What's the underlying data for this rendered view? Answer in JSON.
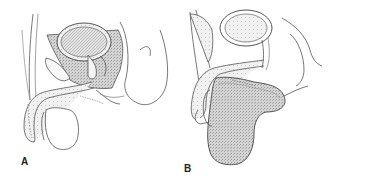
{
  "figure": {
    "panels": [
      {
        "id": "A",
        "label": "A"
      },
      {
        "id": "B",
        "label": "B"
      }
    ],
    "colors": {
      "line": "#555555",
      "fill_stipple": "#c8c8c8",
      "background": "#ffffff",
      "label": "#222222"
    }
  }
}
